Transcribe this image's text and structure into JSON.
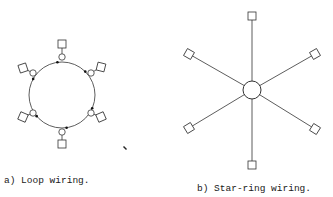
{
  "figure": {
    "panels": [
      {
        "id": "a",
        "caption": "a) Loop wiring.",
        "topology": "loop",
        "ring": {
          "cx": 62,
          "cy": 95,
          "r": 33
        },
        "nodes": [
          {
            "name": "top",
            "junction": [
              62,
              57
            ],
            "box": [
              62,
              44
            ]
          },
          {
            "name": "upper-right",
            "junction": [
              91,
              73
            ],
            "box": [
              101,
              67
            ]
          },
          {
            "name": "lower-right",
            "junction": [
              91,
              113
            ],
            "box": [
              101,
              117
            ]
          },
          {
            "name": "bottom",
            "junction": [
              62,
              132
            ],
            "box": [
              62,
              144
            ]
          },
          {
            "name": "lower-left",
            "junction": [
              33,
              113
            ],
            "box": [
              23,
              117
            ]
          },
          {
            "name": "upper-left",
            "junction": [
              33,
              73
            ],
            "box": [
              23,
              68
            ]
          }
        ]
      },
      {
        "id": "b",
        "caption": "b) Star-ring wiring.",
        "topology": "star-ring",
        "hub": {
          "cx": 252,
          "cy": 90,
          "r": 9
        },
        "nodes": [
          {
            "name": "top",
            "box": [
              252,
              16
            ]
          },
          {
            "name": "upper-right",
            "box": [
              315,
              54
            ]
          },
          {
            "name": "lower-right",
            "box": [
              315,
              129
            ]
          },
          {
            "name": "bottom",
            "box": [
              252,
              165
            ]
          },
          {
            "name": "lower-left",
            "box": [
              189,
              128
            ]
          },
          {
            "name": "upper-left",
            "box": [
              189,
              54
            ]
          }
        ]
      }
    ],
    "stray_mark": [
      125,
      148
    ],
    "colors": {
      "ink": "#333333",
      "background": "#ffffff"
    }
  }
}
